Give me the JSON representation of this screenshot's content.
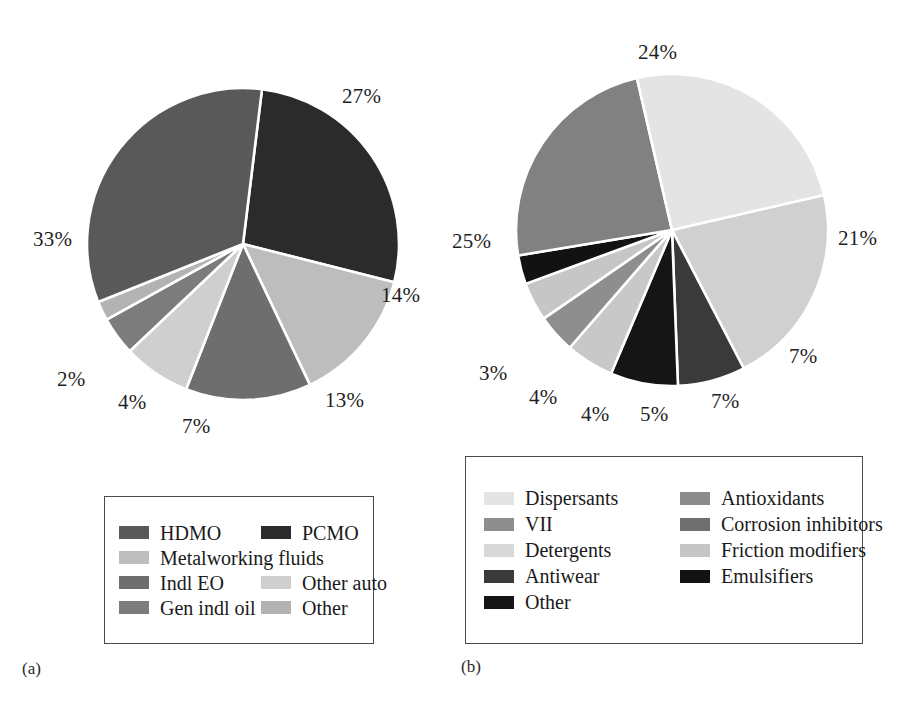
{
  "figure": {
    "background": "#ffffff",
    "captions": [
      {
        "id": "a",
        "text": "(a)"
      },
      {
        "id": "b",
        "text": "(b)"
      }
    ]
  },
  "chart_data": [
    {
      "type": "pie",
      "id": "chart-a",
      "title": "",
      "subcaption": "(a)",
      "legend_position": "bottom",
      "grid": false,
      "categories": [
        "PCMO",
        "Metalworking fluids",
        "Indl EO",
        "Other auto",
        "Gen indl oil",
        "Other",
        "HDMO"
      ],
      "values": [
        27,
        14,
        13,
        7,
        4,
        2,
        33
      ],
      "labels": [
        "27%",
        "14%",
        "13%",
        "7%",
        "4%",
        "2%",
        "33%"
      ],
      "colors": [
        "#2b2b2b",
        "#bdbdbd",
        "#6e6e6e",
        "#cfcfcf",
        "#7c7c7c",
        "#b3b3b3",
        "#595959"
      ],
      "legend_entries": [
        {
          "label": "HDMO",
          "color": "#595959"
        },
        {
          "label": "PCMO",
          "color": "#2b2b2b"
        },
        {
          "label": "Metalworking fluids",
          "color": "#bdbdbd"
        },
        {
          "label": "Indl EO",
          "color": "#6e6e6e"
        },
        {
          "label": "Other auto",
          "color": "#cfcfcf"
        },
        {
          "label": "Gen indl oil",
          "color": "#7c7c7c"
        },
        {
          "label": "Other",
          "color": "#b3b3b3"
        }
      ]
    },
    {
      "type": "pie",
      "id": "chart-b",
      "title": "",
      "subcaption": "(b)",
      "legend_position": "bottom",
      "grid": false,
      "categories": [
        "Detergents",
        "Antioxidants",
        "Other",
        "Friction modifiers",
        "VII",
        "Corrosion inhibitors",
        "Emulsifiers",
        "Antiwear",
        "Dispersants"
      ],
      "values": [
        21,
        7,
        7,
        5,
        4,
        4,
        3,
        24,
        25
      ],
      "labels": [
        "21%",
        "7%",
        "7%",
        "5%",
        "4%",
        "4%",
        "3%",
        "24%",
        "25%"
      ],
      "colors": [
        "#d0d0d0",
        "#3a3a3a",
        "#151515",
        "#c8c8c8",
        "#8e8e8e",
        "#c6c6c6",
        "#121212",
        "#818181",
        "#e4e4e4"
      ],
      "legend_entries": [
        {
          "label": "Dispersants",
          "color": "#e4e4e4"
        },
        {
          "label": "Antioxidants",
          "color": "#8b8b8b"
        },
        {
          "label": "VII",
          "color": "#8e8e8e"
        },
        {
          "label": "Corrosion inhibitors",
          "color": "#6f6f6f"
        },
        {
          "label": "Detergents",
          "color": "#d8d8d8"
        },
        {
          "label": "Friction modifiers",
          "color": "#c6c6c6"
        },
        {
          "label": "Antiwear",
          "color": "#3a3a3a"
        },
        {
          "label": "Emulsifiers",
          "color": "#121212"
        },
        {
          "label": "Other",
          "color": "#151515"
        }
      ]
    }
  ]
}
